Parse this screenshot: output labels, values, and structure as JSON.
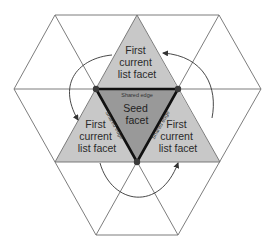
{
  "diagram": {
    "colors": {
      "background": "#ffffff",
      "grid_line": "#6e6e6e",
      "current_facet_fill": "#c8c8c8",
      "seed_facet_fill": "#999999",
      "seed_edge": "#111111",
      "vertex_dot": "#3a3a3a",
      "arrow": "#333333"
    },
    "seed_facet": {
      "label_lines": [
        "Seed",
        "facet"
      ]
    },
    "current_facets": [
      {
        "position": "top",
        "label_lines": [
          "First",
          "current",
          "list facet"
        ]
      },
      {
        "position": "left",
        "label_lines": [
          "First",
          "current",
          "list facet"
        ]
      },
      {
        "position": "right",
        "label_lines": [
          "First",
          "current",
          "list facet"
        ]
      }
    ],
    "shared_edges": [
      {
        "position": "top",
        "label": "Shared edge"
      },
      {
        "position": "left",
        "label": "Shared edge"
      },
      {
        "position": "right",
        "label": "Shared edge"
      }
    ],
    "arrows": [
      {
        "from": "right-facet",
        "to": "top-facet"
      },
      {
        "from": "top-facet",
        "to": "left-facet"
      },
      {
        "from": "left-facet",
        "to": "right-facet"
      }
    ]
  }
}
